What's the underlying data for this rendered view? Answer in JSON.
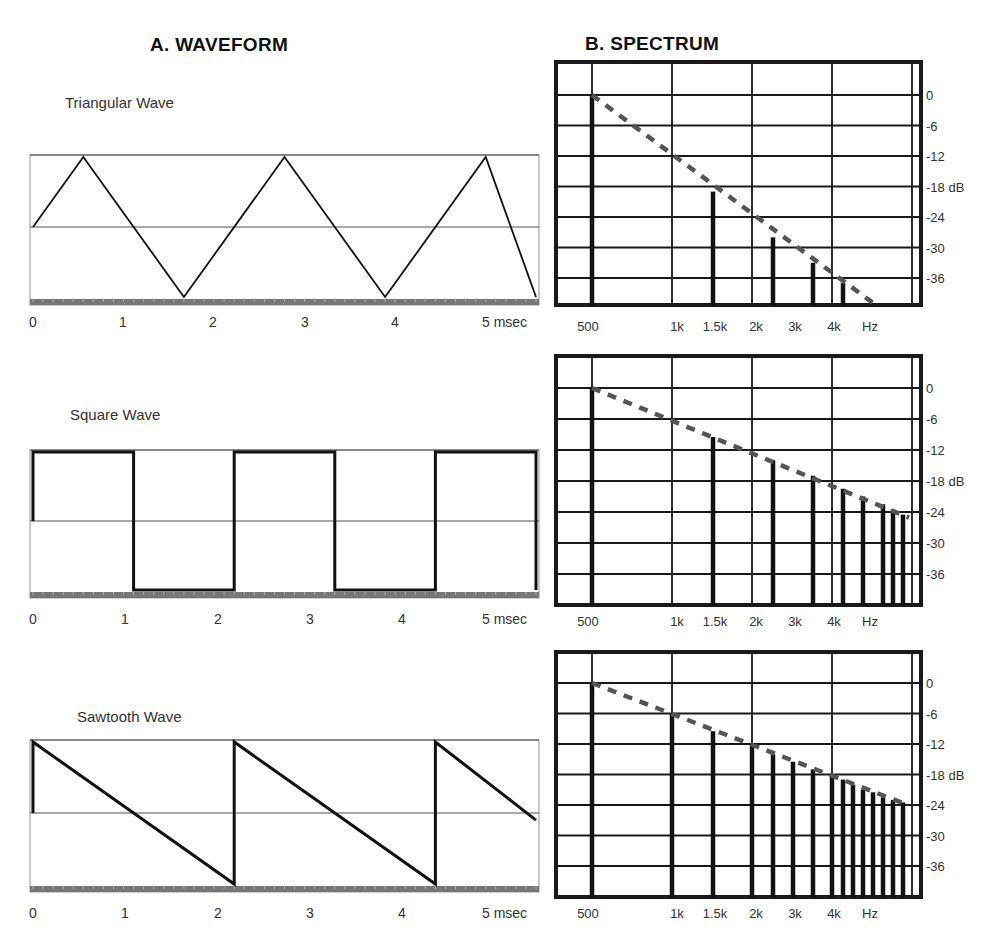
{
  "headings": {
    "waveform": "A.  WAVEFORM",
    "spectrum": "B.  SPECTRUM"
  },
  "waveforms": [
    {
      "title": "Triangular Wave",
      "type": "triangle"
    },
    {
      "title": "Square Wave",
      "type": "square"
    },
    {
      "title": "Sawtooth Wave",
      "type": "sawtooth"
    }
  ],
  "waveform_axis": {
    "ticks": [
      "0",
      "1",
      "2",
      "3",
      "4",
      "5 msec"
    ]
  },
  "spectrum_axis": {
    "x_ticks": [
      "500",
      "1k",
      "1.5k",
      "2k",
      "3k",
      "4k",
      "Hz"
    ],
    "y_ticks": [
      "0",
      "-6",
      "-12",
      "-18 dB",
      "-24",
      "-30",
      "-36"
    ]
  },
  "colors": {
    "line": "#111111",
    "grid": "#1a1a1a",
    "dashed_envelope": "#555555",
    "baseline_strip": "#777777"
  },
  "chart_data": [
    {
      "type": "line",
      "title": "Triangular Wave",
      "xlabel": "msec",
      "x_ticks": [
        0,
        1,
        2,
        3,
        4,
        5
      ],
      "x": [
        0,
        0.5,
        1.5,
        2.5,
        3.5,
        4.5,
        5
      ],
      "y": [
        0,
        1,
        -1,
        1,
        -1,
        1,
        -1
      ],
      "ylim": [
        -1,
        1
      ],
      "period_ms": 2
    },
    {
      "type": "line",
      "title": "Square Wave",
      "xlabel": "msec",
      "x_ticks": [
        0,
        1,
        2,
        3,
        4,
        5
      ],
      "x": [
        0,
        0,
        1,
        1,
        2,
        2,
        3,
        3,
        4,
        4,
        5,
        5
      ],
      "y": [
        0,
        1,
        1,
        -1,
        -1,
        1,
        1,
        -1,
        -1,
        1,
        1,
        -1
      ],
      "ylim": [
        -1,
        1
      ],
      "period_ms": 2
    },
    {
      "type": "line",
      "title": "Sawtooth Wave",
      "xlabel": "msec",
      "x_ticks": [
        0,
        1,
        2,
        3,
        4,
        5
      ],
      "x": [
        0,
        0,
        2,
        2,
        4,
        4,
        5
      ],
      "y": [
        0,
        1,
        -1,
        1,
        -1,
        1,
        -0.1
      ],
      "ylim": [
        -1,
        1
      ],
      "period_ms": 2
    },
    {
      "type": "bar",
      "title": "Triangular Wave Spectrum",
      "xlabel": "Hz",
      "ylabel": "dB",
      "x_tick_labels": [
        "500",
        "1k",
        "1.5k",
        "2k",
        "3k",
        "4k"
      ],
      "categories": [
        "500",
        "1500",
        "2500",
        "3500",
        "4500"
      ],
      "values": [
        0,
        -19,
        -28,
        -33,
        -37
      ],
      "envelope": "-12 dB/octave",
      "ylim": [
        -42,
        0
      ]
    },
    {
      "type": "bar",
      "title": "Square Wave Spectrum",
      "xlabel": "Hz",
      "ylabel": "dB",
      "x_tick_labels": [
        "500",
        "1k",
        "1.5k",
        "2k",
        "3k",
        "4k"
      ],
      "categories": [
        "500",
        "1500",
        "2500",
        "3500",
        "4500",
        "5500",
        "6500",
        "7500",
        "8500"
      ],
      "values": [
        0,
        -9.5,
        -14,
        -17,
        -19.5,
        -21,
        -22.5,
        -23.5,
        -24.5
      ],
      "envelope": "-6 dB/octave",
      "ylim": [
        -42,
        0
      ]
    },
    {
      "type": "bar",
      "title": "Sawtooth Wave Spectrum",
      "xlabel": "Hz",
      "ylabel": "dB",
      "x_tick_labels": [
        "500",
        "1k",
        "1.5k",
        "2k",
        "3k",
        "4k"
      ],
      "categories": [
        "500",
        "1000",
        "1500",
        "2000",
        "2500",
        "3000",
        "3500",
        "4000",
        "4500",
        "5000",
        "5500",
        "6000",
        "6500",
        "7000",
        "7500"
      ],
      "values": [
        0,
        -6,
        -9.5,
        -12,
        -14,
        -15.5,
        -17,
        -18,
        -19,
        -20,
        -21,
        -21.5,
        -22.5,
        -23,
        -23.5
      ],
      "envelope": "-6 dB/octave",
      "ylim": [
        -42,
        0
      ]
    }
  ]
}
